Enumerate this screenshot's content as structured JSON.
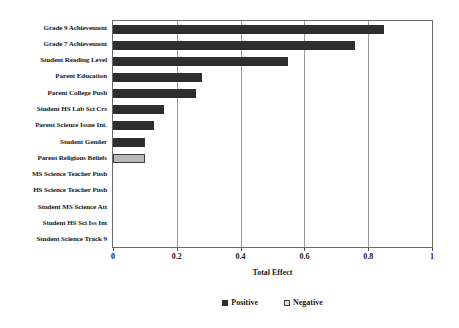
{
  "chart_data": {
    "type": "bar",
    "orientation": "horizontal",
    "title": "",
    "xlabel": "Total Effect",
    "ylabel": "",
    "xlim": [
      0,
      1
    ],
    "xticks": [
      "0",
      "0.2",
      "0.4",
      "0.6",
      "0.8",
      "1"
    ],
    "xtick_values": [
      0,
      0.2,
      0.4,
      0.6,
      0.8,
      1
    ],
    "grid": "vertical",
    "legend_position": "bottom-center",
    "categories": [
      "Grade 9 Achievement",
      "Grade 7 Achievement",
      "Student Reading Level",
      "Parent Education",
      "Parent College Push",
      "Student HS Lab Sci Crs",
      "Parent Science Issue Int.",
      "Student Gender",
      "Parent Religious Beliefs",
      "MS Science Teacher Push",
      "HS Science Teacher Push",
      "Student MS Science Att",
      "Student HS Sci Iss Int",
      "Student Science Track 9"
    ],
    "values": [
      0.85,
      0.76,
      0.55,
      0.28,
      0.26,
      0.16,
      0.13,
      0.1,
      0.1,
      0,
      0,
      0,
      0,
      0
    ],
    "signs": [
      "positive",
      "positive",
      "positive",
      "positive",
      "positive",
      "positive",
      "positive",
      "positive",
      "negative",
      "none",
      "none",
      "none",
      "none",
      "none"
    ],
    "series": [
      {
        "name": "Positive",
        "color": "#2e2e2e",
        "values": [
          0.85,
          0.76,
          0.55,
          0.28,
          0.26,
          0.16,
          0.13,
          0.1,
          0,
          0,
          0,
          0,
          0,
          0
        ]
      },
      {
        "name": "Negative",
        "color": "#b9b9b9",
        "values": [
          0,
          0,
          0,
          0,
          0,
          0,
          0,
          0,
          0.1,
          0,
          0,
          0,
          0,
          0
        ]
      }
    ],
    "legend": [
      {
        "label": "Positive",
        "swatch": "positive"
      },
      {
        "label": "Negative",
        "swatch": "negative"
      }
    ]
  }
}
